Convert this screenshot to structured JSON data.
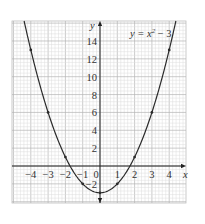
{
  "chart_data": {
    "type": "line",
    "title": "",
    "equation_label": "y = x² − 3",
    "equation_parts": {
      "lhs": "y = x",
      "exp": "2",
      "rhs": " − 3"
    },
    "xlabel": "x",
    "ylabel": "y",
    "xlim": [
      -4.9,
      4.9
    ],
    "ylim": [
      -4,
      15.8
    ],
    "x_ticks": [
      -4,
      -3,
      -2,
      -1,
      0,
      1,
      2,
      3,
      4
    ],
    "x_tick_labels": [
      "−4",
      "−3",
      "−2",
      "−1",
      "0",
      "1",
      "2",
      "3",
      "4"
    ],
    "y_ticks": [
      -2,
      2,
      4,
      6,
      8,
      10,
      12,
      14
    ],
    "y_tick_labels": [
      "−2",
      "2",
      "4",
      "6",
      "8",
      "10",
      "12",
      "14"
    ],
    "grid": true,
    "series": [
      {
        "name": "y = x² − 3",
        "x": [
          -4,
          -3,
          -2,
          -1,
          0,
          1,
          2,
          3,
          4
        ],
        "values": [
          13,
          6,
          1,
          -2,
          -3,
          -2,
          1,
          6,
          13
        ]
      }
    ],
    "colors": {
      "curve": "#2a2a2a",
      "axis": "#222222",
      "grid_major": "#b5b5b5",
      "grid_minor": "#dcdcdc",
      "frame": "#bdbdbd",
      "text": "#333333"
    }
  }
}
